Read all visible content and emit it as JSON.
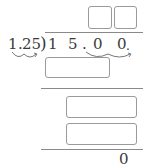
{
  "problem": {
    "divisor": "1.25",
    "divisor_parts": {
      "int": "1",
      "dot": ".",
      "frac": "25"
    },
    "bracket": ")",
    "dividend_digits": [
      "1",
      "5",
      ".",
      "0",
      "0"
    ],
    "dividend_tail_dot": ".",
    "remainder": "0"
  },
  "answer_boxes": [
    {
      "id": "quotient-digit-1",
      "value": ""
    },
    {
      "id": "quotient-digit-2",
      "value": ""
    }
  ],
  "work_boxes": [
    {
      "id": "product-1",
      "value": ""
    },
    {
      "id": "difference-1",
      "value": ""
    },
    {
      "id": "product-2",
      "value": ""
    }
  ],
  "colors": {
    "box_border": "#9a9a9a",
    "line": "#8a8a8a",
    "text": "#3a3a3a"
  }
}
